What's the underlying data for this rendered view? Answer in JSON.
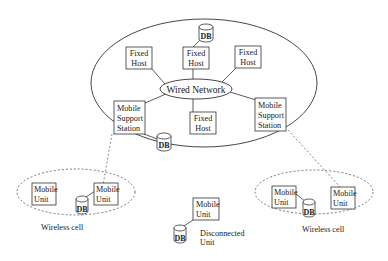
{
  "diagram": {
    "colors": {
      "stroke": "#333333",
      "background": "#ffffff",
      "text": "#1a1a1a"
    },
    "wired_network": {
      "label": "Wired Network"
    },
    "fixed_hosts": [
      {
        "line1": "Fixed",
        "line2": "Host"
      },
      {
        "line1": "Fixed",
        "line2": "Host"
      },
      {
        "line1": "Fixed",
        "line2": "Host"
      },
      {
        "line1": "Fixed",
        "line2": "Host"
      }
    ],
    "mobile_support_stations": [
      {
        "line1": "Mobile",
        "line2": "Support",
        "line3": "Station"
      },
      {
        "line1": "Mobile",
        "line2": "Support",
        "line3": "Station"
      }
    ],
    "mobile_units": [
      {
        "line1": "Mobile",
        "line2": "Unit"
      },
      {
        "line1": "Mobile",
        "line2": "Unit"
      },
      {
        "line1": "Mobile",
        "line2": "Unit"
      },
      {
        "line1": "Mobile",
        "line2": "Unit"
      },
      {
        "line1": "Mobile",
        "line2": "Unit"
      }
    ],
    "db_label": "DB",
    "wireless_cell_label": "Wireless cell",
    "disconnected_unit": {
      "line1": "Disconnected",
      "line2": "Unit"
    }
  }
}
